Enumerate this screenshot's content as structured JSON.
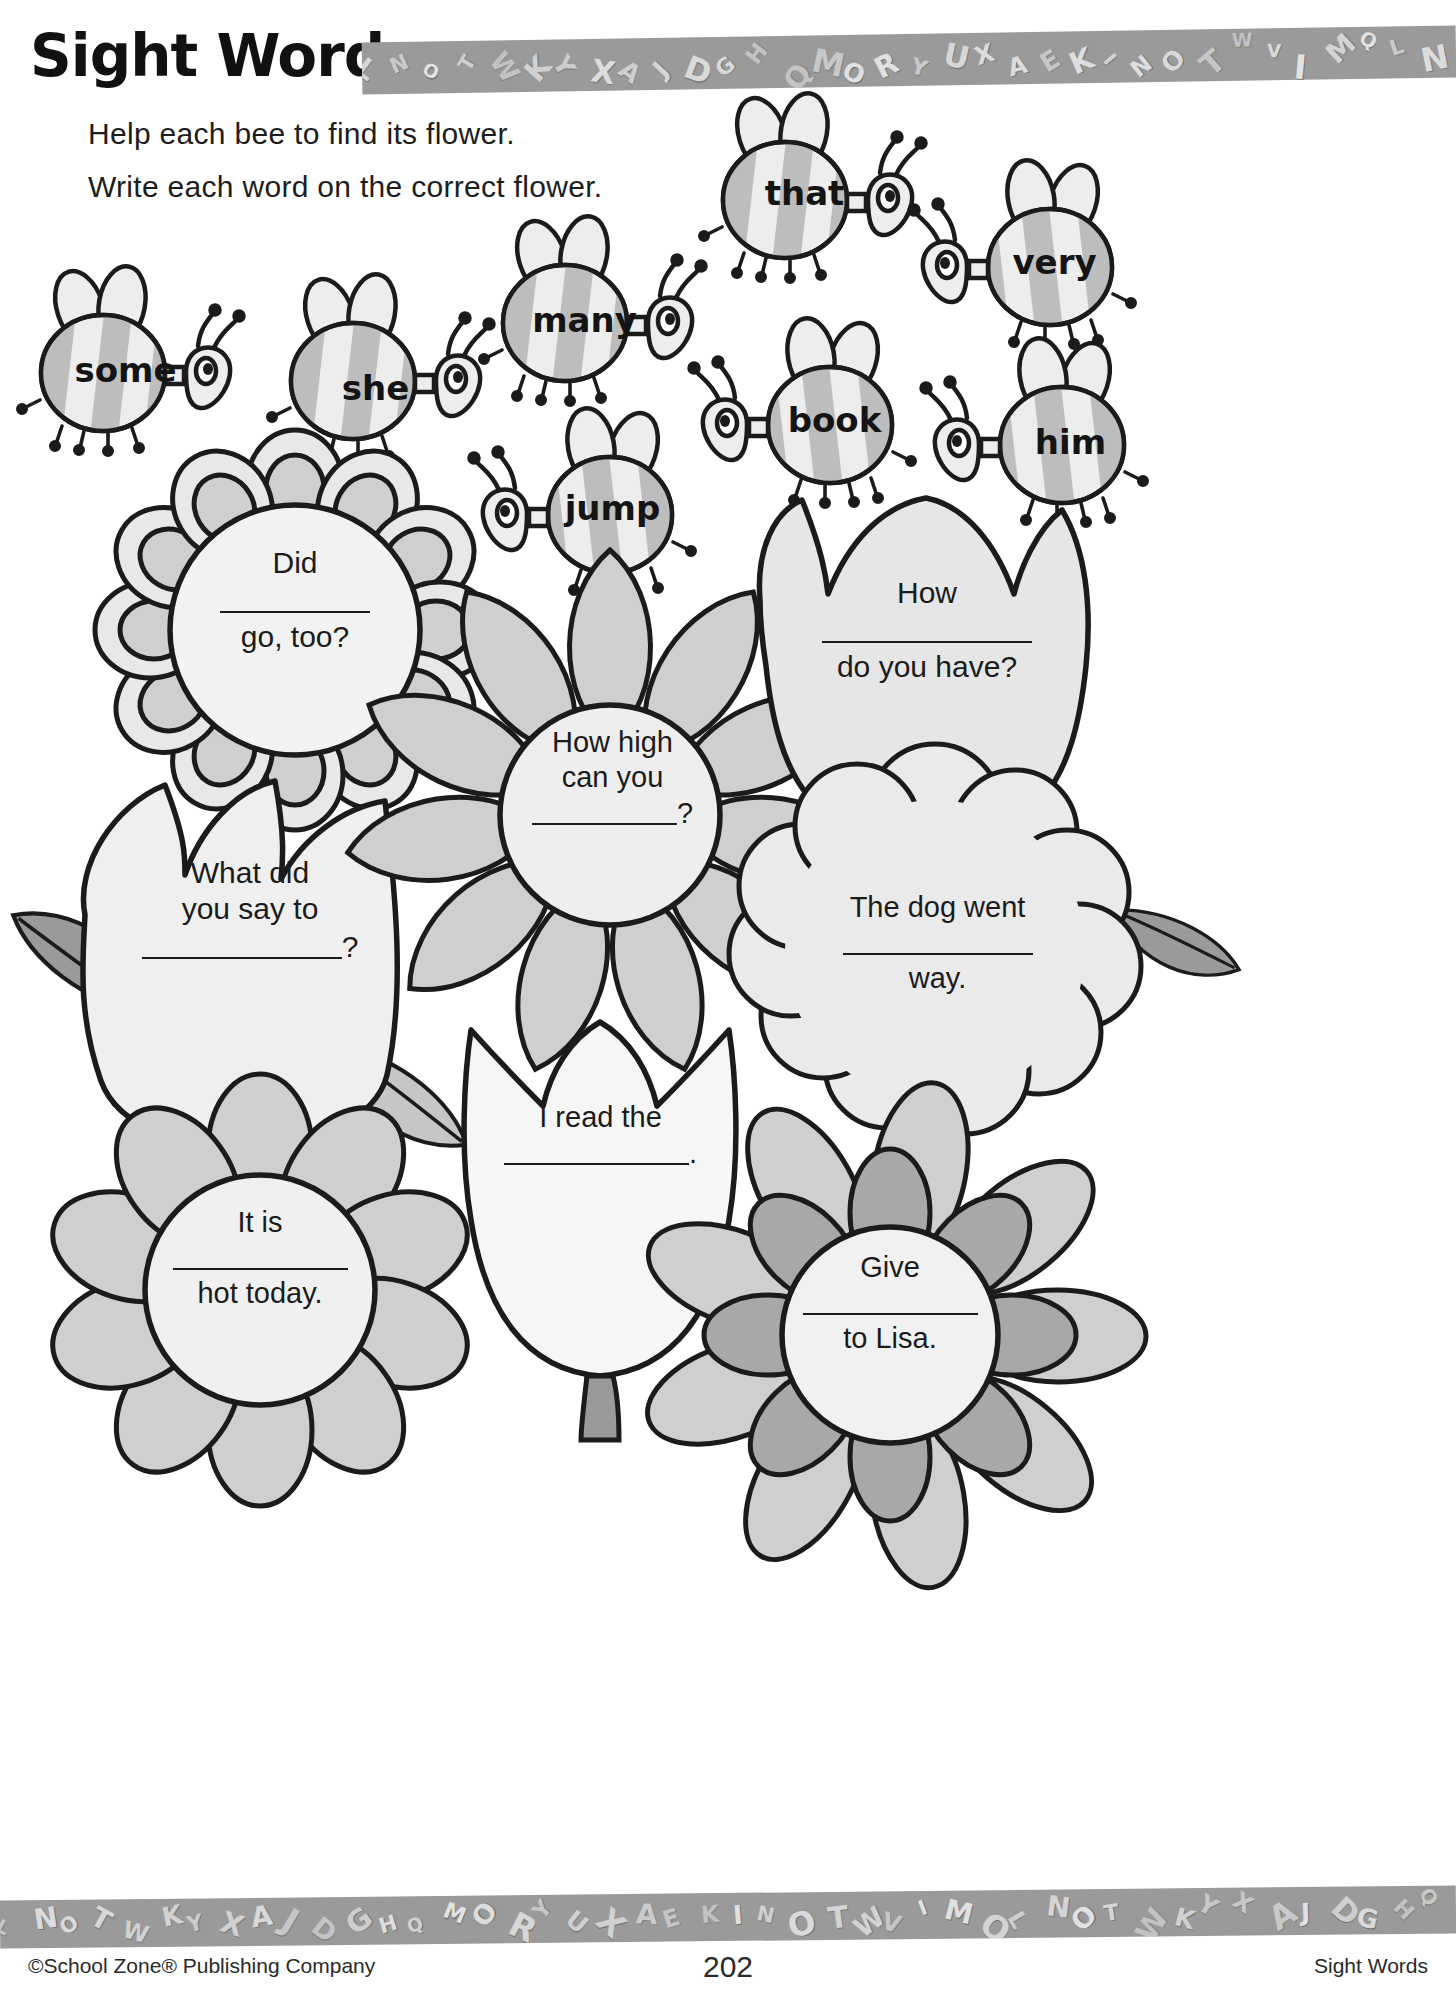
{
  "header": {
    "title": "Sight Words",
    "band_letters": "LNOTWKYXAJDGHQMORYUXAEKINOTWVIMQ"
  },
  "instructions": {
    "line1": "Help each bee to find its flower.",
    "line2": "Write each word on the correct flower."
  },
  "bees": [
    {
      "word": "some",
      "facing": "right",
      "x": 18,
      "y": 268,
      "w": 215,
      "h": 175,
      "wordx": 0,
      "wordy": 82
    },
    {
      "word": "she",
      "facing": "right",
      "x": 268,
      "y": 276,
      "w": 215,
      "h": 175,
      "wordx": 0,
      "wordy": 92
    },
    {
      "word": "many",
      "facing": "right",
      "x": 480,
      "y": 218,
      "w": 225,
      "h": 180,
      "wordx": -8,
      "wordy": 82
    },
    {
      "word": "jump",
      "facing": "left",
      "x": 470,
      "y": 410,
      "w": 225,
      "h": 180,
      "wordx": 30,
      "wordy": 78
    },
    {
      "word": "that",
      "facing": "right",
      "x": 700,
      "y": 95,
      "w": 225,
      "h": 180,
      "wordx": -8,
      "wordy": 78
    },
    {
      "word": "very",
      "facing": "left",
      "x": 910,
      "y": 162,
      "w": 225,
      "h": 180,
      "wordx": 32,
      "wordy": 80
    },
    {
      "word": "book",
      "facing": "left",
      "x": 690,
      "y": 320,
      "w": 225,
      "h": 180,
      "wordx": 32,
      "wordy": 80
    },
    {
      "word": "him",
      "facing": "left",
      "x": 922,
      "y": 340,
      "w": 225,
      "h": 180,
      "wordx": 36,
      "wordy": 82
    }
  ],
  "flowers": [
    {
      "name": "daisy-did",
      "type": "daisy",
      "lines": [
        "Did",
        "____blank____",
        "go, too?"
      ],
      "line1": "Did",
      "line3": "go, too?"
    },
    {
      "name": "tulip-what-did",
      "type": "tulip",
      "line1": "What did",
      "line2": "you say to",
      "line3": "?"
    },
    {
      "name": "sunflower-how-high",
      "type": "sunflower",
      "line1": "How high",
      "line2": "can you",
      "line3": "?"
    },
    {
      "name": "tulip-i-read",
      "type": "tulip2",
      "line1": "I read the",
      "line3": "."
    },
    {
      "name": "tulip-how-do-you-have",
      "type": "tulip-top-right",
      "line1": "How",
      "line3": "do you have?"
    },
    {
      "name": "cloudflower-dog-went",
      "type": "cloud",
      "line1": "The dog went",
      "line3": "way."
    },
    {
      "name": "daisy-it-is",
      "type": "daisy-bottom",
      "line1": "It is",
      "line3": "hot today."
    },
    {
      "name": "daisy-give",
      "type": "daisy-give",
      "line1": "Give",
      "line3": "to Lisa."
    }
  ],
  "footer": {
    "left": "©School Zone® Publishing Company",
    "page_number": "202",
    "right": "Sight Words"
  },
  "colors": {
    "ink": "#1b1b1b",
    "petal_light": "#e8e8e8",
    "petal_mid": "#cfcfcf",
    "petal_dark": "#a8a8a8",
    "leaf_dark": "#9a9a9a",
    "leaf_light": "#c6c6c6",
    "bee_body": "#ededed",
    "bee_stripe": "#bdbdbd",
    "band": "#9a9a9a"
  }
}
